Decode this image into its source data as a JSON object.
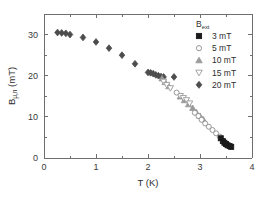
{
  "chart_data": {
    "type": "scatter",
    "title": "",
    "xlabel": "T (K)",
    "ylabel": "B",
    "ylabel_sub": "μ,n",
    "ylabel_unit": " (mT)",
    "xlim": [
      0,
      4
    ],
    "ylim": [
      0,
      35
    ],
    "xticks": [
      0,
      1,
      2,
      3,
      4
    ],
    "xticklabels": [
      "0",
      "1",
      "2",
      "3",
      "4"
    ],
    "xminorticks": [
      0.5,
      1.5,
      2.5,
      3.5
    ],
    "yticks": [
      0,
      10,
      20,
      30
    ],
    "yticklabels": [
      "0",
      "10",
      "20",
      "30"
    ],
    "yminorticks": [
      5,
      15,
      25,
      35
    ],
    "grid": false,
    "legend_position": "top-right",
    "legend_title": "B",
    "legend_title_sub": "ext",
    "series": [
      {
        "name": "3 mT",
        "label": "3 mT",
        "marker": "filled-square",
        "color": "#1a1a1a",
        "filled": true,
        "points": [
          {
            "x": 3.4,
            "y": 4.8
          },
          {
            "x": 3.44,
            "y": 4.1
          },
          {
            "x": 3.47,
            "y": 3.7
          },
          {
            "x": 3.5,
            "y": 3.4
          },
          {
            "x": 3.53,
            "y": 3.1
          },
          {
            "x": 3.57,
            "y": 2.9
          },
          {
            "x": 3.6,
            "y": 2.7
          }
        ]
      },
      {
        "name": "5 mT",
        "label": "5 mT",
        "marker": "open-circle",
        "color": "#8c8c8c",
        "filled": false,
        "points": [
          {
            "x": 2.55,
            "y": 15.9
          },
          {
            "x": 2.9,
            "y": 11.0
          },
          {
            "x": 2.97,
            "y": 10.2
          },
          {
            "x": 3.03,
            "y": 9.3
          },
          {
            "x": 3.1,
            "y": 8.4
          },
          {
            "x": 3.17,
            "y": 7.6
          },
          {
            "x": 3.24,
            "y": 6.8
          },
          {
            "x": 3.31,
            "y": 6.0
          },
          {
            "x": 3.38,
            "y": 5.2
          }
        ]
      },
      {
        "name": "10 mT",
        "label": "10 mT",
        "marker": "filled-triangle-up",
        "color": "#9a9a9a",
        "filled": true,
        "points": [
          {
            "x": 2.27,
            "y": 19.3
          },
          {
            "x": 2.33,
            "y": 18.4
          },
          {
            "x": 2.4,
            "y": 17.4
          },
          {
            "x": 2.62,
            "y": 14.9
          },
          {
            "x": 2.7,
            "y": 14.0
          },
          {
            "x": 2.78,
            "y": 13.0
          },
          {
            "x": 2.86,
            "y": 12.1
          },
          {
            "x": 2.93,
            "y": 11.1
          },
          {
            "x": 3.0,
            "y": 10.2
          },
          {
            "x": 3.06,
            "y": 9.4
          }
        ]
      },
      {
        "name": "15 mT",
        "label": "15 mT",
        "marker": "open-triangle-down",
        "color": "#9a9a9a",
        "filled": false,
        "points": [
          {
            "x": 2.3,
            "y": 18.6
          },
          {
            "x": 2.36,
            "y": 17.8
          },
          {
            "x": 2.43,
            "y": 17.0
          },
          {
            "x": 2.62,
            "y": 15.1
          },
          {
            "x": 2.68,
            "y": 14.6
          },
          {
            "x": 2.74,
            "y": 14.1
          },
          {
            "x": 2.8,
            "y": 13.3
          }
        ]
      },
      {
        "name": "20 mT",
        "label": "20 mT",
        "marker": "filled-diamond",
        "color": "#4d4d4d",
        "filled": true,
        "points": [
          {
            "x": 0.26,
            "y": 30.5
          },
          {
            "x": 0.34,
            "y": 30.4
          },
          {
            "x": 0.42,
            "y": 30.3
          },
          {
            "x": 0.5,
            "y": 30.0
          },
          {
            "x": 0.75,
            "y": 29.3
          },
          {
            "x": 1.0,
            "y": 28.2
          },
          {
            "x": 1.25,
            "y": 26.7
          },
          {
            "x": 1.5,
            "y": 25.0
          },
          {
            "x": 1.75,
            "y": 22.9
          },
          {
            "x": 2.0,
            "y": 20.8
          },
          {
            "x": 2.05,
            "y": 20.7
          },
          {
            "x": 2.1,
            "y": 20.5
          },
          {
            "x": 2.15,
            "y": 20.2
          },
          {
            "x": 2.2,
            "y": 20.0
          },
          {
            "x": 2.25,
            "y": 19.8
          },
          {
            "x": 2.3,
            "y": 19.7
          },
          {
            "x": 2.5,
            "y": 19.7
          }
        ]
      }
    ]
  },
  "axes": {
    "frame_color": "#6f6f6f"
  }
}
